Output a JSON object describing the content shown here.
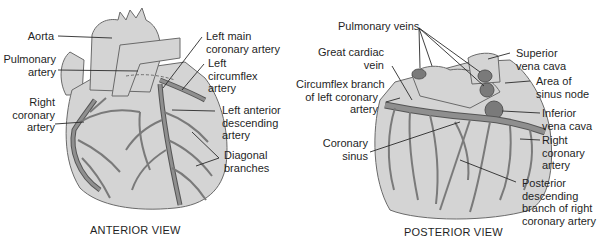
{
  "figure": {
    "anterior": {
      "caption": "ANTERIOR VIEW",
      "labels": {
        "aorta": "Aorta",
        "pulmonary_artery": [
          "Pulmonary",
          "artery"
        ],
        "right_coronary_artery": [
          "Right",
          "coronary",
          "artery"
        ],
        "left_main_coronary_artery": [
          "Left main",
          "coronary artery"
        ],
        "left_circumflex_artery": [
          "Left",
          "circumflex",
          "artery"
        ],
        "left_anterior_descending_artery": [
          "Left anterior",
          "descending",
          "artery"
        ],
        "diagonal_branches": [
          "Diagonal",
          "branches"
        ]
      }
    },
    "posterior": {
      "caption": "POSTERIOR VIEW",
      "labels": {
        "pulmonary_veins": "Pulmonary veins",
        "great_cardiac_vein": [
          "Great cardiac",
          "vein"
        ],
        "circumflex_branch": [
          "Circumflex branch",
          "of left coronary",
          "artery"
        ],
        "coronary_sinus": [
          "Coronary",
          "sinus"
        ],
        "superior_vena_cava": [
          "Superior",
          "vena cava"
        ],
        "area_of_sinus_node": [
          "Area of",
          "sinus node"
        ],
        "inferior_vena_cava": [
          "Inferior",
          "vena cava"
        ],
        "right_coronary_artery": [
          "Right",
          "coronary",
          "artery"
        ],
        "posterior_descending_branch": [
          "Posterior",
          "descending",
          "branch of right",
          "coronary artery"
        ]
      }
    },
    "colors": {
      "heart_fill": "#d4d4d4",
      "heart_outline": "#6a6a6a",
      "vessel_fill": "#8f8f8f",
      "vessel_outline": "#555555",
      "dark_spot": "#7a7a7a",
      "leader_line": "#2a2a2a"
    }
  }
}
